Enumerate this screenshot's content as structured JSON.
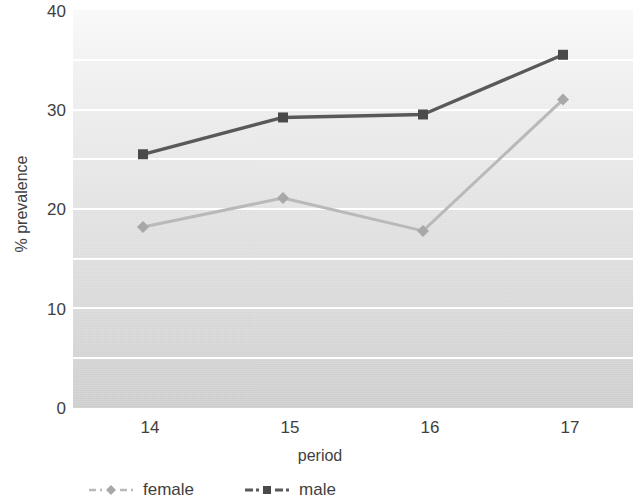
{
  "chart_data": {
    "type": "line",
    "title": "",
    "xlabel": "period",
    "ylabel": "% prevalence",
    "categories": [
      "14",
      "15",
      "16",
      "17"
    ],
    "x": [
      14,
      15,
      16,
      17
    ],
    "xlim": [
      13.5,
      17.5
    ],
    "ylim": [
      0,
      40
    ],
    "yticks": [
      0,
      10,
      20,
      30,
      40
    ],
    "ytick_labels": [
      "0",
      "10",
      "20",
      "30",
      "40"
    ],
    "xtick_labels": [
      "14",
      "15",
      "16",
      "17"
    ],
    "grid": "horizontal",
    "gridline_interval": 5,
    "gridline_values": [
      5,
      10,
      15,
      20,
      25,
      30,
      35
    ],
    "legend_position": "bottom-left",
    "series": [
      {
        "name": "female",
        "values": [
          18.2,
          21.1,
          17.8,
          31.0
        ],
        "color": "#b9b9b9",
        "marker": "diamond"
      },
      {
        "name": "male",
        "values": [
          25.5,
          29.2,
          29.5,
          35.5
        ],
        "color": "#595959",
        "marker": "square"
      }
    ]
  },
  "legend": {
    "items": [
      {
        "label": "female",
        "marker": "diamond-marker-icon",
        "color": "#b9b9b9"
      },
      {
        "label": "male",
        "marker": "square-marker-icon",
        "color": "#595959"
      }
    ]
  },
  "axes": {
    "y_title": "% prevalence",
    "x_title": "period",
    "y_tick_0": "0",
    "y_tick_10": "10",
    "y_tick_20": "20",
    "y_tick_30": "30",
    "y_tick_40": "40",
    "x_tick_14": "14",
    "x_tick_15": "15",
    "x_tick_16": "16",
    "x_tick_17": "17"
  },
  "colors": {
    "female_series": "#b9b9b9",
    "male_series": "#595959",
    "gridline": "#ffffff",
    "text": "#3f3f3f",
    "plot_bg_top": "#fbfbfb",
    "plot_bg_bottom": "#cfcfcf"
  }
}
